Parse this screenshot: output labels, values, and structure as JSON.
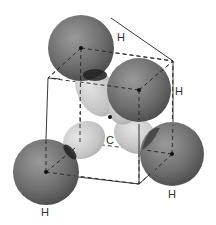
{
  "diagram": {
    "atoms": [
      {
        "id": "H1",
        "label": "H",
        "x": 81,
        "y": 48,
        "r": 33,
        "label_x": 117,
        "label_y": 41
      },
      {
        "id": "H2",
        "label": "H",
        "x": 139,
        "y": 90,
        "r": 32,
        "label_x": 175,
        "label_y": 95
      },
      {
        "id": "H3",
        "label": "H",
        "x": 46,
        "y": 172,
        "r": 33,
        "label_x": 41,
        "label_y": 216
      },
      {
        "id": "H4",
        "label": "H",
        "x": 172,
        "y": 154,
        "r": 32,
        "label_x": 168,
        "label_y": 198
      }
    ],
    "center": {
      "label": "C",
      "x": 110,
      "y": 117,
      "label_x": 106,
      "label_y": 144
    },
    "colors": {
      "hydrogen": "#6e6e6e",
      "orbital": "#c8c8c8",
      "edge": "#222222",
      "background": "#ffffff"
    }
  }
}
